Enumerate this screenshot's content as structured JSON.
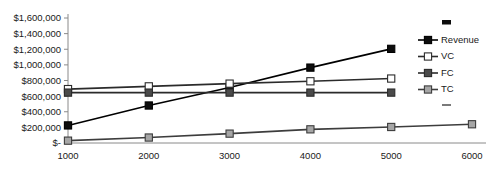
{
  "chart_data": {
    "type": "line",
    "title": "",
    "xlabel": "",
    "ylabel": "",
    "x": [
      1000,
      2000,
      3000,
      4000,
      5000,
      6000
    ],
    "categories": [
      "1000",
      "2000",
      "3000",
      "4000",
      "5000",
      "6000"
    ],
    "xlim": [
      1000,
      6000
    ],
    "ylim": [
      0,
      1600000
    ],
    "grid": false,
    "legend_position": "right",
    "ytick_labels": [
      "$1,600,000",
      "$1,400,000",
      "$1,200,000",
      "$1,000,000",
      "$800,000",
      "$600,000",
      "$400,000",
      "$200,000",
      "$-"
    ],
    "ytick_values": [
      1600000,
      1400000,
      1200000,
      1000000,
      800000,
      600000,
      400000,
      200000,
      0
    ],
    "xtick_labels": [
      "1000",
      "2000",
      "3000",
      "4000",
      "5000",
      "6000"
    ],
    "series": [
      {
        "name": "Revenue",
        "marker": "filled-square",
        "color": "#000000",
        "marker_fill": "#0d0d0d",
        "x": [
          1000,
          2000,
          3000,
          4000,
          5000
        ],
        "values": [
          225000,
          480000,
          710000,
          965000,
          1205000
        ]
      },
      {
        "name": "VC",
        "marker": "hollow-square",
        "color": "#2b2b2b",
        "marker_fill": "#ffffff",
        "x": [
          1000,
          2000,
          3000,
          4000,
          5000
        ],
        "values": [
          690000,
          725000,
          760000,
          790000,
          825000
        ]
      },
      {
        "name": "FC",
        "marker": "dark-gray-square",
        "color": "#2b2b2b",
        "marker_fill": "#4a4a4a",
        "x": [
          1000,
          2000,
          3000,
          4000,
          5000
        ],
        "values": [
          645000,
          645000,
          645000,
          645000,
          645000
        ]
      },
      {
        "name": "TC",
        "marker": "light-gray-square",
        "color": "#3d3d3d",
        "marker_fill": "#a6a6a6",
        "x": [
          1000,
          2000,
          3000,
          4000,
          5000,
          6000
        ],
        "values": [
          30000,
          70000,
          120000,
          175000,
          205000,
          240000
        ]
      }
    ]
  },
  "legend": {
    "items": [
      {
        "label": "Revenue"
      },
      {
        "label": "VC"
      },
      {
        "label": "FC"
      },
      {
        "label": "TC"
      }
    ]
  }
}
